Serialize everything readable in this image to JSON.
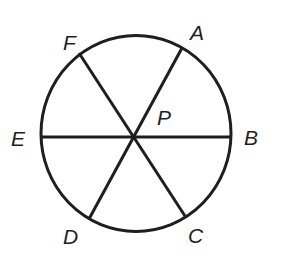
{
  "diagram": {
    "type": "circle-with-diameters",
    "center": {
      "label": "P",
      "x": 134,
      "y": 137
    },
    "circle": {
      "cx": 136,
      "cy": 133,
      "rx": 95,
      "ry": 98
    },
    "stroke_color": "#1e1e1e",
    "points": [
      {
        "label": "A",
        "x": 182,
        "y": 48,
        "label_x": 192,
        "label_y": 39
      },
      {
        "label": "B",
        "x": 231,
        "y": 137,
        "label_x": 244,
        "label_y": 145
      },
      {
        "label": "C",
        "x": 185,
        "y": 216,
        "label_x": 188,
        "label_y": 243
      },
      {
        "label": "D",
        "x": 89,
        "y": 219,
        "label_x": 63,
        "label_y": 244
      },
      {
        "label": "E",
        "x": 41,
        "y": 137,
        "label_x": 11,
        "label_y": 146
      },
      {
        "label": "F",
        "x": 79,
        "y": 53,
        "label_x": 63,
        "label_y": 50
      }
    ],
    "segments": [
      {
        "name": "AD",
        "from": "A",
        "to": "D"
      },
      {
        "name": "BE",
        "from": "B",
        "to": "E"
      },
      {
        "name": "CF",
        "from": "C",
        "to": "F"
      }
    ],
    "center_label_pos": {
      "x": 157,
      "y": 124
    }
  }
}
